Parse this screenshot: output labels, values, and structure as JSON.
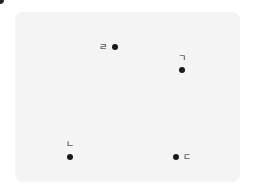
{
  "diagram": {
    "background_color": "#f4f4f4",
    "dot_color": "#1a1a1a",
    "points": [
      {
        "label": "ㄱ",
        "dot": {
          "x": 182,
          "y": 70
        },
        "label_pos": {
          "x": 182,
          "y": 58
        }
      },
      {
        "label": "ㄴ",
        "dot": {
          "x": 70,
          "y": 157
        },
        "label_pos": {
          "x": 70,
          "y": 144
        }
      },
      {
        "label": "ㄷ",
        "dot": {
          "x": 176,
          "y": 157
        },
        "label_pos": {
          "x": 187,
          "y": 157
        }
      },
      {
        "label": "ㄹ",
        "dot": {
          "x": 115,
          "y": 47
        },
        "label_pos": {
          "x": 103,
          "y": 47
        }
      }
    ]
  }
}
